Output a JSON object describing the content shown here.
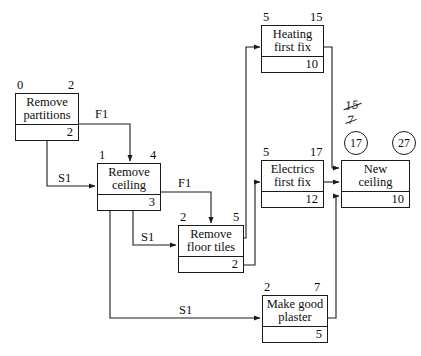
{
  "diagram": {
    "type": "precedence-network",
    "nodes": [
      {
        "id": "remove-partitions",
        "label": "Remove\npartitions",
        "early_start": "0",
        "early_finish": "2",
        "duration": "2"
      },
      {
        "id": "remove-ceiling",
        "label": "Remove\nceiling",
        "early_start": "1",
        "early_finish": "4",
        "duration": "3"
      },
      {
        "id": "remove-floor-tiles",
        "label": "Remove\nfloor tiles",
        "early_start": "2",
        "early_finish": "5",
        "duration": "2"
      },
      {
        "id": "heating-first-fix",
        "label": "Heating\nfirst fix",
        "early_start": "5",
        "early_finish": "15",
        "duration": "10"
      },
      {
        "id": "electrics-first-fix",
        "label": "Electrics\nfirst fix",
        "early_start": "5",
        "early_finish": "17",
        "duration": "12"
      },
      {
        "id": "new-ceiling",
        "label": "New\nceiling",
        "early_start": "",
        "early_finish": "",
        "duration": "10"
      },
      {
        "id": "make-good-plaster",
        "label": "Make good\nplaster",
        "early_start": "2",
        "early_finish": "7",
        "duration": "5"
      }
    ],
    "circled_values": [
      {
        "id": "new-ceiling-start",
        "value": "17"
      },
      {
        "id": "new-ceiling-finish",
        "value": "27"
      }
    ],
    "annotations": [
      {
        "id": "crossed-out-15",
        "value": "15",
        "struck": true
      },
      {
        "id": "crossed-out-7",
        "value": "7",
        "struck": true
      }
    ],
    "edge_labels": [
      {
        "id": "partitions-to-ceiling",
        "value": "F1"
      },
      {
        "id": "partitions-to-ceiling-start",
        "value": "S1"
      },
      {
        "id": "ceiling-to-floor-tiles-finish",
        "value": "F1"
      },
      {
        "id": "ceiling-to-floor-tiles-start",
        "value": "S1"
      },
      {
        "id": "ceiling-to-plaster",
        "value": "S1"
      }
    ]
  }
}
